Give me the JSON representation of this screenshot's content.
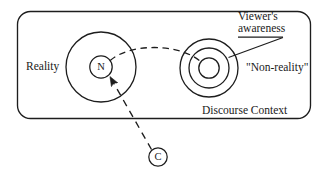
{
  "diagram": {
    "title_text": "Reality / Non-reality discourse context diagram",
    "stroke_color": "#1d1d1d",
    "background_color": "#ffffff",
    "labels": {
      "reality": "Reality",
      "non_reality": "\"Non-reality\"",
      "discourse_context": "Discourse Context",
      "viewer_awareness_line1": "Viewer's",
      "viewer_awareness_line2": "awareness"
    },
    "nodes": {
      "n_marker": "N",
      "c_marker": "C"
    },
    "shapes": {
      "container": {
        "name": "discourse-context-frame",
        "x": 17,
        "y": 11,
        "width": 294,
        "height": 108,
        "radius": 13
      },
      "reality_circle": {
        "name": "reality-circle",
        "cx": 101,
        "cy": 67,
        "r": 35
      },
      "n_circle": {
        "name": "n-circle",
        "cx": 101,
        "cy": 67,
        "r": 11
      },
      "nonreality_outer": {
        "name": "nonreality-outer-circle",
        "cx": 209,
        "cy": 68,
        "r": 29
      },
      "nonreality_middle": {
        "name": "nonreality-middle-circle",
        "cx": 209,
        "cy": 68,
        "r": 20
      },
      "nonreality_inner": {
        "name": "nonreality-inner-circle",
        "cx": 209,
        "cy": 68,
        "r": 10
      },
      "c_circle": {
        "name": "c-circle",
        "cx": 158,
        "cy": 157,
        "r": 9
      }
    },
    "connectors": {
      "awareness_link": {
        "name": "awareness-dashed-link",
        "style": "dashed",
        "from": "n-circle",
        "to": "nonreality-inner-circle"
      },
      "c_to_n_arrow": {
        "name": "c-to-n-dashed-arrow",
        "style": "dashed",
        "from": "c-circle",
        "to": "n-circle",
        "arrowhead": true
      },
      "viewer_leader": {
        "name": "viewer-awareness-leader-line",
        "style": "solid",
        "from": "viewer-awareness-label",
        "to": "nonreality-outer-circle"
      }
    }
  }
}
